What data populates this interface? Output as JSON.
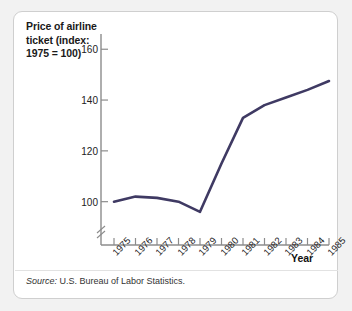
{
  "figure": {
    "title": "Price of airline ticket (index: 1975 = 100)",
    "title_lines": [
      "Price of airline",
      "ticket (index:",
      "1975 = 100)"
    ],
    "source_label": "Source:",
    "source_text": " U.S. Bureau of Labor Statistics.",
    "line_color": "#3f3a63",
    "axis_color": "#8c8c8c",
    "text_color": "#222222",
    "background": "#ffffff",
    "page_background": "#f2f2f2",
    "border_color": "#cfcfcf"
  },
  "chart_data": {
    "type": "line",
    "title": "Price of airline ticket (index: 1975 = 100)",
    "xlabel": "Year",
    "ylabel": "Price of airline ticket (index: 1975 = 100)",
    "categories": [
      "1975",
      "1976",
      "1977",
      "1978",
      "1979",
      "1980",
      "1981",
      "1982",
      "1983",
      "1984",
      "1985"
    ],
    "x": [
      1975,
      1976,
      1977,
      1978,
      1979,
      1980,
      1981,
      1982,
      1983,
      1984,
      1985
    ],
    "values": [
      100,
      102,
      101.5,
      100,
      96,
      115,
      133,
      138,
      141,
      144,
      147.5
    ],
    "ytick_labels": [
      "100",
      "120",
      "140",
      "160"
    ],
    "yticks": [
      100,
      120,
      140,
      160
    ],
    "ylim": [
      92,
      166
    ],
    "xlim": [
      1975,
      1985
    ],
    "grid": false,
    "legend": false,
    "axis_break": true,
    "series": [
      {
        "name": "Price of airline ticket (index: 1975 = 100)",
        "values": [
          100,
          102,
          101.5,
          100,
          96,
          115,
          133,
          138,
          141,
          144,
          147.5
        ]
      }
    ]
  }
}
